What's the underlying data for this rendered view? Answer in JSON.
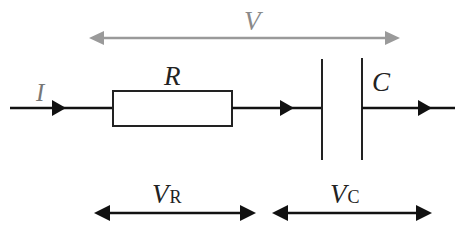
{
  "diagram": {
    "type": "series RC circuit",
    "labels": {
      "total_voltage": "V",
      "current": "I",
      "resistor": "R",
      "capacitor": "C",
      "resistor_voltage_main": "V",
      "resistor_voltage_sub": "R",
      "capacitor_voltage_main": "V",
      "capacitor_voltage_sub": "C"
    },
    "colors": {
      "wire": "#111111",
      "total_voltage_arrow": "#9a9a9a",
      "label_total_voltage": "#8a8a8a",
      "label_current": "#777777",
      "label": "#222222"
    }
  }
}
